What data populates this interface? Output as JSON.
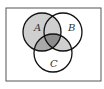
{
  "diagram": {
    "type": "venn",
    "sets": [
      {
        "name": "A",
        "label": "A"
      },
      {
        "name": "B",
        "label": "B"
      },
      {
        "name": "C",
        "label": "C"
      }
    ],
    "shaded_regions": [
      {
        "region": "A only",
        "shade": "light"
      },
      {
        "region": "A∩B (not C)",
        "shade": "light"
      },
      {
        "region": "B∩C (not A)",
        "shade": "light"
      },
      {
        "region": "A∩C (not B)",
        "shade": "medium"
      },
      {
        "region": "A∩B∩C",
        "shade": "dark"
      }
    ],
    "colors": {
      "light": "#cfcfcf",
      "medium": "#a9a9a9",
      "dark": "#8c8c8c",
      "stroke": "#111111",
      "frame": "#555555"
    }
  }
}
